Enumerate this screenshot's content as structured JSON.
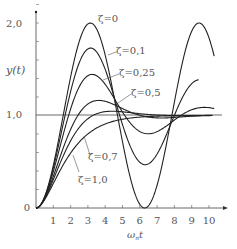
{
  "chart_data": {
    "type": "line",
    "title": "",
    "xlabel": "ω_n t",
    "ylabel": "y(t)",
    "xlim": [
      0,
      11
    ],
    "ylim": [
      0,
      2.1
    ],
    "x_ticks": [
      "1",
      "2",
      "3",
      "4",
      "5",
      "6",
      "7",
      "8",
      "9",
      "10"
    ],
    "y_ticks": [
      "0",
      "1.0",
      "2.0"
    ],
    "y_tick_labels": {
      "zero": "0",
      "one": "1,0",
      "two": "2,0"
    },
    "grid": false,
    "reference_line": 1.0,
    "series": [
      {
        "name": "ζ=0",
        "zeta": 0
      },
      {
        "name": "ζ=0.1",
        "zeta": 0.1
      },
      {
        "name": "ζ=0.25",
        "zeta": 0.25
      },
      {
        "name": "ζ=0.5",
        "zeta": 0.5
      },
      {
        "name": "ζ=0.7",
        "zeta": 0.7
      },
      {
        "name": "ζ=1.0",
        "zeta": 1.0
      }
    ],
    "annotations": [
      "ζ=0",
      "ζ=0,1",
      "ζ=0,25",
      "ζ=0,5",
      "ζ=0,7",
      "ζ=1,0"
    ]
  },
  "labels": {
    "y_axis": "y(t)",
    "x_axis_main": "ω",
    "x_axis_sub": "n",
    "x_axis_t": "t",
    "z0": "ζ=0",
    "z01": "ζ=0,1",
    "z025": "ζ=0,25",
    "z05": "ζ=0,5",
    "z07": "ζ=0,7",
    "z10": "ζ=1,0",
    "y2": "2,0",
    "y1": "1,0",
    "y0": "0"
  }
}
